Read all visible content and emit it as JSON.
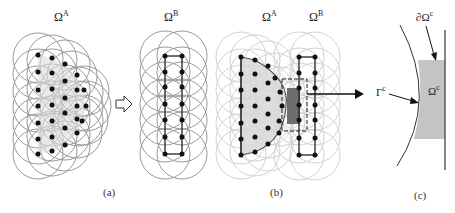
{
  "figure": {
    "panels": [
      {
        "id": "a",
        "caption": "(a)",
        "subfigures": [
          {
            "label_base": "Ω",
            "label_sup": "A",
            "description": "semicircular point cloud with overlapping support circles"
          },
          {
            "label_base": "Ω",
            "label_sup": "B",
            "description": "two-column rectangular point cloud with overlapping support circles"
          }
        ],
        "connector_symbol": "⇨"
      },
      {
        "id": "b",
        "caption": "(b)",
        "labels": [
          {
            "label_base": "Ω",
            "label_sup": "A"
          },
          {
            "label_base": "Ω",
            "label_sup": "B"
          }
        ],
        "description": "overlapping domains with dashed coupling region and dark overlap rectangle"
      },
      {
        "id": "c",
        "caption": "(c)",
        "labels": {
          "boundary": {
            "label_base": "∂Ω",
            "label_sup": "c"
          },
          "interface": {
            "label_base": "Γ",
            "label_sup": "c"
          },
          "region": {
            "label_base": "Ω",
            "label_sup": "c"
          }
        },
        "description": "zoomed coupling region bounded by curved interface and straight line"
      }
    ],
    "colors": {
      "circle_stroke": "#9a9a9a",
      "circle_stroke_faint": "#cfcfcf",
      "node_fill": "#111111",
      "domain_fill": "#d8d8d8",
      "overlap_fill": "#6e6e6e",
      "coupling_fill": "#c4c4c4",
      "line": "#222222"
    }
  }
}
